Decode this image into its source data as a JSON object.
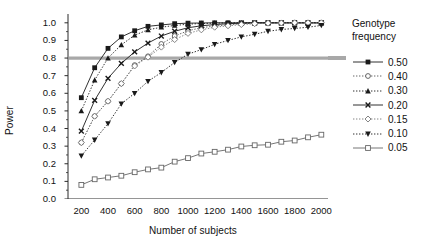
{
  "chart_data": {
    "type": "line",
    "title": "",
    "xlabel": "Number of subjects",
    "ylabel": "Power",
    "xlim": [
      100,
      2050
    ],
    "ylim": [
      0.0,
      1.05
    ],
    "xticks": [
      200,
      400,
      600,
      800,
      1000,
      1200,
      1400,
      1600,
      1800,
      2000
    ],
    "yticks": [
      "0.0",
      "0.1",
      "0.2",
      "0.3",
      "0.4",
      "0.5",
      "0.6",
      "0.7",
      "0.8",
      "0.9",
      "1.0"
    ],
    "grid": false,
    "legend_position": "right",
    "legend_title": "Genotype frequency",
    "reference_line": {
      "y": 0.8,
      "color": "#a8a8a8",
      "width": 3.2,
      "label": ""
    },
    "x": [
      200,
      300,
      400,
      500,
      600,
      700,
      800,
      900,
      1000,
      1100,
      1200,
      1300,
      1400,
      1500,
      1600,
      1700,
      1800,
      1900,
      2000
    ],
    "series": [
      {
        "name": "0.50",
        "marker": "filled-square",
        "line": "solid",
        "color": "#1a1a1a",
        "values": [
          0.575,
          0.745,
          0.855,
          0.92,
          0.955,
          0.98,
          0.988,
          0.995,
          0.998,
          0.999,
          1.0,
          1.0,
          1.0,
          1.0,
          1.0,
          1.0,
          1.0,
          1.0,
          1.0
        ]
      },
      {
        "name": "0.40",
        "marker": "open-circle",
        "line": "dotted",
        "color": "#555555",
        "values": [
          0.32,
          0.47,
          0.555,
          0.655,
          0.76,
          0.81,
          0.88,
          0.925,
          0.955,
          0.972,
          0.982,
          0.988,
          0.995,
          0.998,
          0.999,
          1.0,
          1.0,
          1.0,
          1.0
        ]
      },
      {
        "name": "0.30",
        "marker": "filled-triangle",
        "line": "dotted",
        "color": "#1a1a1a",
        "values": [
          0.5,
          0.675,
          0.8,
          0.875,
          0.93,
          0.96,
          0.975,
          0.985,
          0.992,
          0.996,
          0.998,
          1.0,
          1.0,
          1.0,
          1.0,
          1.0,
          1.0,
          1.0,
          1.0
        ]
      },
      {
        "name": "0.20",
        "marker": "cross-x",
        "line": "solid",
        "color": "#1a1a1a",
        "values": [
          0.385,
          0.56,
          0.685,
          0.77,
          0.835,
          0.885,
          0.925,
          0.952,
          0.972,
          0.983,
          0.99,
          0.995,
          0.998,
          1.0,
          1.0,
          1.0,
          1.0,
          1.0,
          1.0
        ]
      },
      {
        "name": "0.15",
        "marker": "open-diamond",
        "line": "dotted",
        "color": "#777777",
        "values": [
          0.32,
          0.47,
          0.555,
          0.655,
          0.755,
          0.805,
          0.862,
          0.905,
          0.94,
          0.96,
          0.975,
          0.983,
          0.99,
          0.995,
          0.998,
          0.999,
          1.0,
          1.0,
          1.0
        ]
      },
      {
        "name": "0.10",
        "marker": "filled-down-triangle",
        "line": "dotted",
        "color": "#1a1a1a",
        "values": [
          0.245,
          0.335,
          0.428,
          0.54,
          0.6,
          0.668,
          0.718,
          0.775,
          0.822,
          0.848,
          0.878,
          0.9,
          0.92,
          0.935,
          0.952,
          0.962,
          0.968,
          0.975,
          0.985
        ]
      },
      {
        "name": "0.05",
        "marker": "open-square",
        "line": "solid",
        "color": "#666666",
        "values": [
          0.08,
          0.112,
          0.122,
          0.132,
          0.152,
          0.168,
          0.178,
          0.212,
          0.232,
          0.258,
          0.268,
          0.28,
          0.298,
          0.305,
          0.308,
          0.325,
          0.332,
          0.35,
          0.365
        ]
      }
    ]
  },
  "legend": {
    "title_line1": "Genotype",
    "title_line2": "frequency",
    "entries": [
      {
        "label": "0.50"
      },
      {
        "label": "0.40"
      },
      {
        "label": "0.30"
      },
      {
        "label": "0.20"
      },
      {
        "label": "0.15"
      },
      {
        "label": "0.10"
      },
      {
        "label": "0.05"
      }
    ]
  },
  "axes": {
    "y_title": "Power",
    "x_title": "Number of subjects"
  }
}
